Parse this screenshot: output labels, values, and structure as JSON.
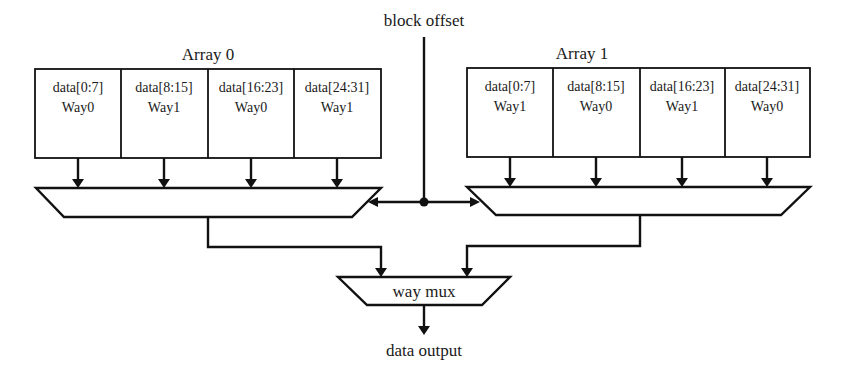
{
  "labels": {
    "block_offset": "block offset",
    "way_mux": "way mux",
    "data_output": "data output"
  },
  "arrays": [
    {
      "title": "Array 0",
      "cells": [
        {
          "data": "data[0:7]",
          "way": "Way0"
        },
        {
          "data": "data[8:15]",
          "way": "Way1"
        },
        {
          "data": "data[16:23]",
          "way": "Way0"
        },
        {
          "data": "data[24:31]",
          "way": "Way1"
        }
      ]
    },
    {
      "title": "Array 1",
      "cells": [
        {
          "data": "data[0:7]",
          "way": "Way1"
        },
        {
          "data": "data[8:15]",
          "way": "Way0"
        },
        {
          "data": "data[16:23]",
          "way": "Way1"
        },
        {
          "data": "data[24:31]",
          "way": "Way0"
        }
      ]
    }
  ]
}
